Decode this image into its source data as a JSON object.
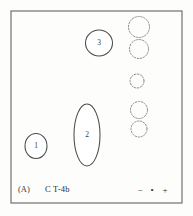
{
  "figure": {
    "panel_label": "(A)",
    "sample_label": "C T-4b",
    "caption_alt": "Two-dimensional separation panel A",
    "colors": {
      "background": "#fdfdfc",
      "frame_stroke": "#6b6b6b",
      "spot_stroke": "#4a4a4a",
      "dashed_stroke": "#8d8d8d",
      "text": "#2f2f2f"
    },
    "frame": {
      "x": 11,
      "y": 11,
      "width": 171,
      "height": 192
    }
  },
  "polarity": {
    "negative": "−",
    "origin": "•",
    "positive": "+"
  },
  "chart_data": {
    "type": "scatter",
    "title": "(A)  C T-4b",
    "xlabel": "",
    "ylabel": "",
    "xlim": [
      11,
      182
    ],
    "ylim": [
      11,
      203
    ],
    "grid": false,
    "legend": "none",
    "annotations": [
      "(A)",
      "C T-4b",
      "−",
      "•",
      "+"
    ],
    "series": [
      {
        "name": "labeled-spots",
        "style": "solid-outline",
        "points": [
          {
            "label": "1",
            "cx": 36,
            "cy": 146,
            "rx": 11,
            "ry": 12.5,
            "shape": "ellipse"
          },
          {
            "label": "2",
            "cx": 87,
            "cy": 135,
            "rx": 13,
            "ry": 31,
            "shape": "elongated-ellipse"
          },
          {
            "label": "3",
            "cx": 99,
            "cy": 43,
            "rx": 13.5,
            "ry": 13,
            "shape": "ellipse"
          }
        ]
      },
      {
        "name": "reference-spots",
        "style": "dashed-outline",
        "points": [
          {
            "label": "",
            "cx": 139,
            "cy": 27,
            "rx": 10.5,
            "ry": 10.5,
            "shape": "circle"
          },
          {
            "label": "",
            "cx": 139,
            "cy": 49,
            "rx": 9.5,
            "ry": 9.5,
            "shape": "circle"
          },
          {
            "label": "",
            "cx": 137,
            "cy": 81,
            "rx": 7.0,
            "ry": 7.0,
            "shape": "circle"
          },
          {
            "label": "",
            "cx": 139,
            "cy": 110,
            "rx": 8.5,
            "ry": 8.5,
            "shape": "circle"
          },
          {
            "label": "",
            "cx": 139,
            "cy": 129,
            "rx": 8.0,
            "ry": 8.0,
            "shape": "circle"
          }
        ]
      }
    ]
  }
}
